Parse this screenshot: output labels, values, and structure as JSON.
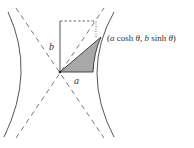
{
  "figure": {
    "labels": {
      "b": "b",
      "a": "a",
      "point": "(a cosh θ,  b sinh θ)",
      "point_parts": {
        "open": "(",
        "a1": "a",
        "cosh": " cosh ",
        "theta1": "θ",
        "comma": ",  ",
        "b1": "b",
        "sinh": " sinh ",
        "theta2": "θ",
        "close": ")"
      }
    },
    "colors": {
      "curve": "#555555",
      "dash": "#666666",
      "shade": "#a8a8a8",
      "text": "#333333"
    }
  }
}
